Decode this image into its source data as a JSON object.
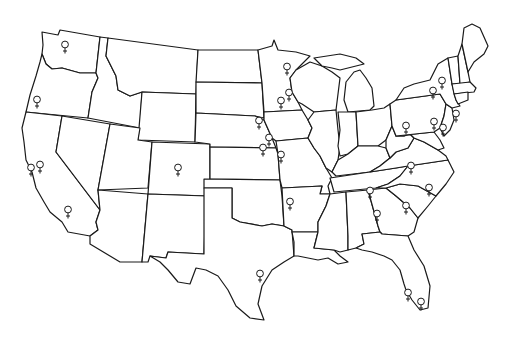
{
  "map": {
    "title": "",
    "region": "Contiguous United States",
    "style": "black outline on white",
    "marker_symbol": "♀",
    "marker_meaning": "female symbol",
    "colors": {
      "outline": "#1a1a1a",
      "background": "#ffffff",
      "marker": "#1a1a1a"
    }
  },
  "markers": [
    {
      "state": "Washington",
      "x": 65,
      "y": 45
    },
    {
      "state": "Oregon",
      "x": 37,
      "y": 100
    },
    {
      "state": "California",
      "x": 31,
      "y": 168
    },
    {
      "state": "California",
      "x": 40,
      "y": 165
    },
    {
      "state": "California",
      "x": 68,
      "y": 210
    },
    {
      "state": "Colorado",
      "x": 178,
      "y": 168
    },
    {
      "state": "Minnesota",
      "x": 287,
      "y": 67
    },
    {
      "state": "Minnesota",
      "x": 289,
      "y": 93
    },
    {
      "state": "Minnesota",
      "x": 281,
      "y": 101
    },
    {
      "state": "Nebraska",
      "x": 259,
      "y": 121
    },
    {
      "state": "Iowa",
      "x": 269,
      "y": 138
    },
    {
      "state": "Kansas",
      "x": 263,
      "y": 148
    },
    {
      "state": "Missouri",
      "x": 281,
      "y": 155
    },
    {
      "state": "Arkansas",
      "x": 290,
      "y": 202
    },
    {
      "state": "Texas",
      "x": 260,
      "y": 274
    },
    {
      "state": "New York",
      "x": 442,
      "y": 81
    },
    {
      "state": "New York",
      "x": 433,
      "y": 91
    },
    {
      "state": "New Jersey",
      "x": 456,
      "y": 114
    },
    {
      "state": "Pennsylvania",
      "x": 406,
      "y": 126
    },
    {
      "state": "Pennsylvania",
      "x": 434,
      "y": 122
    },
    {
      "state": "Pennsylvania",
      "x": 443,
      "y": 128
    },
    {
      "state": "Virginia",
      "x": 411,
      "y": 166
    },
    {
      "state": "North Carolina",
      "x": 429,
      "y": 188
    },
    {
      "state": "Tennessee",
      "x": 370,
      "y": 191
    },
    {
      "state": "South Carolina",
      "x": 406,
      "y": 206
    },
    {
      "state": "Georgia",
      "x": 377,
      "y": 214
    },
    {
      "state": "Florida",
      "x": 408,
      "y": 293
    },
    {
      "state": "Florida",
      "x": 421,
      "y": 302
    }
  ]
}
